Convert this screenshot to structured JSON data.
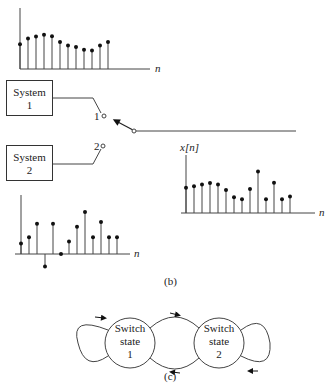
{
  "figure": {
    "panel_b_caption": "(b)",
    "panel_c_caption": "(c)"
  },
  "systems": [
    {
      "label_line1": "System",
      "label_line2": "1"
    },
    {
      "label_line1": "System",
      "label_line2": "2"
    }
  ],
  "switch": {
    "terminal_1_label": "1",
    "terminal_2_label": "2",
    "position": "terminal 1"
  },
  "plots": {
    "system1_output": {
      "axis_label": "n",
      "values": [
        0.55,
        0.68,
        0.72,
        0.76,
        0.73,
        0.6,
        0.52,
        0.49,
        0.43,
        0.41,
        0.52,
        0.6
      ]
    },
    "system2_output": {
      "axis_label": "n",
      "values": [
        0.25,
        0.4,
        0.72,
        -0.3,
        0.72,
        0.0,
        0.3,
        0.65,
        1.0,
        0.4,
        0.76,
        0.4,
        0.4
      ]
    },
    "output": {
      "axis_label": "n",
      "y_label": "x[n]",
      "values": [
        0.55,
        0.58,
        0.62,
        0.65,
        0.62,
        0.5,
        0.34,
        0.3,
        0.52,
        0.9,
        0.3,
        0.66,
        0.3,
        0.36
      ]
    }
  },
  "state_diagram": {
    "states": [
      {
        "line1": "Switch",
        "line2": "state",
        "line3": "1"
      },
      {
        "line1": "Switch",
        "line2": "state",
        "line3": "2"
      }
    ]
  }
}
